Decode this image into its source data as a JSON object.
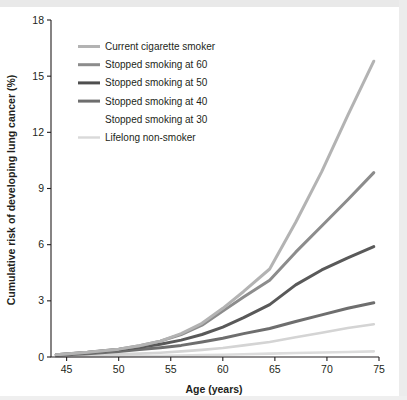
{
  "chart_data": {
    "type": "line",
    "title": "",
    "xlabel": "Age (years)",
    "ylabel": "Cumulative risk of developing lung cancer (%)",
    "xlim": [
      43.5,
      75
    ],
    "ylim": [
      0,
      18
    ],
    "xticks": [
      45,
      50,
      55,
      60,
      65,
      70,
      75
    ],
    "yticks": [
      0,
      3,
      6,
      9,
      12,
      15,
      18
    ],
    "grid": false,
    "legend_position": "upper-left",
    "x": [
      44,
      47,
      50,
      52,
      54,
      56,
      58,
      60,
      62,
      64.5,
      67,
      69.5,
      72,
      74.5
    ],
    "series": [
      {
        "name": "Current cigarette smoker",
        "color": "#b3b3b3",
        "width": 3.0,
        "values": [
          0.12,
          0.25,
          0.42,
          0.6,
          0.85,
          1.25,
          1.8,
          2.6,
          3.5,
          4.7,
          7.2,
          9.9,
          12.9,
          15.8
        ]
      },
      {
        "name": "Stopped smoking at 60",
        "color": "#8c8c8c",
        "width": 3.0,
        "values": [
          0.12,
          0.25,
          0.42,
          0.6,
          0.85,
          1.2,
          1.7,
          2.45,
          3.2,
          4.1,
          5.6,
          7.0,
          8.4,
          9.85
        ]
      },
      {
        "name": "Stopped smoking at 50",
        "color": "#595959",
        "width": 3.0,
        "values": [
          0.12,
          0.24,
          0.4,
          0.52,
          0.68,
          0.9,
          1.2,
          1.6,
          2.1,
          2.8,
          3.85,
          4.65,
          5.3,
          5.9
        ]
      },
      {
        "name": "Stopped smoking at 40",
        "color": "#6e6e6e",
        "width": 3.0,
        "values": [
          0.1,
          0.18,
          0.3,
          0.4,
          0.5,
          0.62,
          0.8,
          1.0,
          1.25,
          1.52,
          1.9,
          2.25,
          2.6,
          2.9
        ]
      },
      {
        "name": "Stopped smoking at 30",
        "color": "#d4d4d4",
        "width": 2.6,
        "values": [
          0.05,
          0.09,
          0.14,
          0.18,
          0.23,
          0.3,
          0.38,
          0.48,
          0.62,
          0.8,
          1.05,
          1.3,
          1.55,
          1.75
        ]
      },
      {
        "name": "Lifelong non-smoker",
        "color": "#dcdcdc",
        "width": 2.6,
        "values": [
          0.02,
          0.03,
          0.04,
          0.05,
          0.06,
          0.08,
          0.1,
          0.12,
          0.15,
          0.18,
          0.21,
          0.24,
          0.27,
          0.3
        ]
      }
    ]
  },
  "legend": {
    "items": [
      {
        "label": "Current cigarette smoker",
        "color": "#b3b3b3",
        "swatch": true
      },
      {
        "label": "Stopped smoking at 60",
        "color": "#8c8c8c",
        "swatch": true
      },
      {
        "label": "Stopped smoking at 50",
        "color": "#4f4f4f",
        "swatch": true
      },
      {
        "label": "Stopped smoking at 40",
        "color": "#6e6e6e",
        "swatch": true
      },
      {
        "label": "Stopped smoking at 30",
        "color": "#ffffff",
        "swatch": false
      },
      {
        "label": "Lifelong non-smoker",
        "color": "#d9d9d9",
        "swatch": true
      }
    ]
  },
  "axes": {
    "x_title": "Age (years)",
    "y_title": "Cumulative risk of developing lung cancer (%)",
    "x_tick_labels": [
      "45",
      "50",
      "55",
      "60",
      "65",
      "70",
      "75"
    ],
    "y_tick_labels": [
      "0",
      "3",
      "6",
      "9",
      "12",
      "15",
      "18"
    ]
  }
}
